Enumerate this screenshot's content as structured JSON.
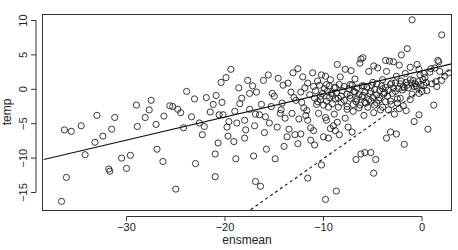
{
  "chart_data": {
    "type": "scatter",
    "title": "",
    "xlabel": "ensmean",
    "ylabel": "temp",
    "xlim": [
      -38.4,
      3.0
    ],
    "ylim": [
      -17.5,
      11.0
    ],
    "xticks": [
      -30,
      -20,
      -10,
      0
    ],
    "yticks": [
      -15,
      -10,
      -5,
      0,
      5,
      10
    ],
    "xtick_labels": [
      "−30",
      "−20",
      "−10",
      "0"
    ],
    "ytick_labels": [
      "−15",
      "−10",
      "−5",
      "0",
      "5",
      "10"
    ],
    "grid": false,
    "legend": null,
    "marker": "open-circle",
    "lines": [
      {
        "name": "regression-fit",
        "style": "solid",
        "x": [
          -38.4,
          3.0
        ],
        "y": [
          -10.2,
          3.7
        ]
      },
      {
        "name": "identity-line",
        "style": "dashed",
        "x": [
          -17.4,
          3.0
        ],
        "y": [
          -17.5,
          3.0
        ]
      }
    ],
    "points": [
      [
        -36.6,
        -16.3
      ],
      [
        -36.1,
        -12.8
      ],
      [
        -35.6,
        -6.1
      ],
      [
        -34.6,
        -5.3
      ],
      [
        -33.2,
        -7.7
      ],
      [
        -31.5,
        -5.8
      ],
      [
        -31.2,
        -4.1
      ],
      [
        -29.6,
        -9.6
      ],
      [
        -30.5,
        -10.0
      ],
      [
        -30.0,
        -11.5
      ],
      [
        -31.8,
        -11.6
      ],
      [
        -31.7,
        -11.9
      ],
      [
        -29.0,
        -2.3
      ],
      [
        -28.1,
        -4.1
      ],
      [
        -27.5,
        -1.6
      ],
      [
        -27.0,
        -5.1
      ],
      [
        -26.3,
        -10.5
      ],
      [
        -25.6,
        -2.4
      ],
      [
        -25.3,
        -2.5
      ],
      [
        -24.5,
        -3.4
      ],
      [
        -25.0,
        -14.5
      ],
      [
        -24.2,
        -5.6
      ],
      [
        -23.4,
        -4.0
      ],
      [
        -23.0,
        -10.8
      ],
      [
        -21.9,
        -1.2
      ],
      [
        -21.5,
        -3.3
      ],
      [
        -21.0,
        -9.4
      ],
      [
        -21.0,
        -12.7
      ],
      [
        -20.6,
        -3.7
      ],
      [
        -19.6,
        -4.7
      ],
      [
        -20.7,
        -7.8
      ],
      [
        -19.1,
        -7.6
      ],
      [
        -18.5,
        -2.1
      ],
      [
        -18.9,
        -10.1
      ],
      [
        -19.8,
        -5.5
      ],
      [
        -18.0,
        -4.5
      ],
      [
        -17.5,
        -0.6
      ],
      [
        -17.0,
        -5.3
      ],
      [
        -16.9,
        -13.4
      ],
      [
        -16.4,
        -14.1
      ],
      [
        -15.9,
        -4.0
      ],
      [
        -15.0,
        -1.0
      ],
      [
        -14.3,
        -3.0
      ],
      [
        -13.9,
        -4.2
      ],
      [
        -13.2,
        -3.5
      ],
      [
        -13.0,
        -1.2
      ],
      [
        -12.8,
        -1.6
      ],
      [
        -12.3,
        -6.5
      ],
      [
        -11.7,
        -3.1
      ],
      [
        -11.3,
        -5.6
      ],
      [
        -10.7,
        -2.2
      ],
      [
        -10.3,
        -1.5
      ],
      [
        -10.0,
        -6.9
      ],
      [
        -9.5,
        -2.6
      ],
      [
        -9.2,
        -0.6
      ],
      [
        -8.9,
        -3.6
      ],
      [
        -8.5,
        -1.3
      ],
      [
        -7.8,
        -4.2
      ],
      [
        -7.3,
        -0.9
      ],
      [
        -6.8,
        -0.4
      ],
      [
        -6.3,
        -2.3
      ],
      [
        -5.9,
        -3.8
      ],
      [
        -5.4,
        -1.5
      ],
      [
        -5.0,
        -1.2
      ],
      [
        -4.6,
        -0.8
      ],
      [
        -4.2,
        -3.0
      ],
      [
        -3.8,
        -0.5
      ],
      [
        -3.2,
        -1.7
      ],
      [
        -2.7,
        -0.3
      ],
      [
        -2.3,
        -2.8
      ],
      [
        -1.8,
        0.2
      ],
      [
        -1.2,
        -1.5
      ],
      [
        -0.8,
        0.4
      ],
      [
        -0.3,
        -0.6
      ],
      [
        0.2,
        0.6
      ],
      [
        0.5,
        -0.2
      ],
      [
        1.0,
        0.8
      ],
      [
        1.5,
        0.4
      ],
      [
        2.0,
        1.3
      ],
      [
        -36.3,
        -5.9
      ],
      [
        -34.2,
        -9.5
      ],
      [
        -33.0,
        -3.8
      ],
      [
        -32.4,
        -6.8
      ],
      [
        -28.9,
        -5.4
      ],
      [
        -27.7,
        -3.0
      ],
      [
        -26.9,
        -8.7
      ],
      [
        -26.2,
        -3.9
      ],
      [
        -22.6,
        -4.9
      ],
      [
        -22.3,
        -6.6
      ],
      [
        -20.3,
        -1.9
      ],
      [
        -19.0,
        -3.2
      ],
      [
        -18.0,
        -7.1
      ],
      [
        -17.5,
        -2.9
      ],
      [
        -16.5,
        -3.7
      ],
      [
        -15.5,
        -4.9
      ],
      [
        -15.3,
        -2.5
      ],
      [
        -14.7,
        -5.5
      ],
      [
        -14.0,
        -8.3
      ],
      [
        -13.5,
        -5.8
      ],
      [
        -12.6,
        -7.9
      ],
      [
        -12.0,
        -2.7
      ],
      [
        -11.6,
        -4.5
      ],
      [
        -11.0,
        -6.0
      ],
      [
        -10.5,
        -3.5
      ],
      [
        -9.8,
        -4.1
      ],
      [
        -9.5,
        -7.1
      ],
      [
        -9.0,
        -5.3
      ],
      [
        -8.6,
        -4.8
      ],
      [
        -8.2,
        -1.9
      ],
      [
        -7.6,
        -2.5
      ],
      [
        -7.0,
        -3.2
      ],
      [
        -6.6,
        -1.4
      ],
      [
        -6.0,
        -0.9
      ],
      [
        -5.7,
        -2.0
      ],
      [
        -5.2,
        -0.3
      ],
      [
        -4.8,
        -2.3
      ],
      [
        -4.4,
        -1.6
      ],
      [
        -4.0,
        0.1
      ],
      [
        -3.5,
        -1.0
      ],
      [
        -3.0,
        -0.6
      ],
      [
        -2.5,
        -1.4
      ],
      [
        -2.0,
        -0.1
      ],
      [
        -1.5,
        0.6
      ],
      [
        -1.0,
        -0.7
      ],
      [
        -0.5,
        0.3
      ],
      [
        0.0,
        -0.3
      ],
      [
        0.4,
        1.0
      ],
      [
        -21.2,
        -2.2
      ],
      [
        -20.9,
        -0.9
      ],
      [
        -20.4,
        1.0
      ],
      [
        -19.9,
        1.7
      ],
      [
        -19.4,
        2.9
      ],
      [
        -18.6,
        0.2
      ],
      [
        -18.3,
        -1.3
      ],
      [
        -17.7,
        1.3
      ],
      [
        -17.2,
        0.5
      ],
      [
        -16.8,
        -0.4
      ],
      [
        -16.1,
        1.3
      ],
      [
        -15.6,
        2.1
      ],
      [
        -15.2,
        -0.6
      ],
      [
        -14.6,
        1.6
      ],
      [
        -14.1,
        0.6
      ],
      [
        -13.6,
        0.9
      ],
      [
        -13.1,
        2.4
      ],
      [
        -12.6,
        3.0
      ],
      [
        -12.1,
        1.8
      ],
      [
        -11.6,
        0.9
      ],
      [
        -11.1,
        2.4
      ],
      [
        -10.6,
        1.2
      ],
      [
        -10.2,
        2.1
      ],
      [
        -9.7,
        0.7
      ],
      [
        -9.3,
        1.4
      ],
      [
        -8.8,
        0.3
      ],
      [
        -8.3,
        1.8
      ],
      [
        -7.8,
        2.9
      ],
      [
        -7.3,
        0.7
      ],
      [
        -6.8,
        1.5
      ],
      [
        -6.3,
        3.8
      ],
      [
        -5.9,
        0.5
      ],
      [
        -5.4,
        2.6
      ],
      [
        -5.0,
        1.0
      ],
      [
        -4.5,
        3.1
      ],
      [
        -4.0,
        1.4
      ],
      [
        -3.6,
        2.6
      ],
      [
        -3.1,
        0.9
      ],
      [
        -2.6,
        1.9
      ],
      [
        -2.2,
        0.8
      ],
      [
        -1.7,
        2.3
      ],
      [
        -1.2,
        1.4
      ],
      [
        -0.7,
        0.8
      ],
      [
        -0.2,
        2.1
      ],
      [
        0.3,
        1.7
      ],
      [
        0.8,
        2.5
      ],
      [
        1.3,
        3.1
      ],
      [
        1.8,
        2.6
      ],
      [
        -12.3,
        -0.4
      ],
      [
        -11.9,
        0.2
      ],
      [
        -11.4,
        -0.8
      ],
      [
        -11.0,
        0.4
      ],
      [
        -10.8,
        -0.2
      ],
      [
        -10.4,
        0.6
      ],
      [
        -10.1,
        -0.6
      ],
      [
        -9.9,
        0.1
      ],
      [
        -9.6,
        -0.3
      ],
      [
        -9.4,
        0.5
      ],
      [
        -9.1,
        -0.9
      ],
      [
        -8.9,
        0.2
      ],
      [
        -8.7,
        -0.5
      ],
      [
        -8.4,
        0.7
      ],
      [
        -8.1,
        -0.2
      ],
      [
        -7.9,
        0.4
      ],
      [
        -7.6,
        -0.7
      ],
      [
        -7.4,
        0.1
      ],
      [
        -7.1,
        0.6
      ],
      [
        -6.9,
        -0.3
      ],
      [
        -6.6,
        0.2
      ],
      [
        -6.4,
        -0.8
      ],
      [
        -6.1,
        0.5
      ],
      [
        -5.8,
        -0.4
      ],
      [
        -5.6,
        0.3
      ],
      [
        -5.3,
        -0.6
      ],
      [
        -5.1,
        0.6
      ],
      [
        -4.8,
        0.0
      ],
      [
        -4.6,
        0.8
      ],
      [
        -4.3,
        -0.2
      ],
      [
        -4.1,
        0.5
      ],
      [
        -3.9,
        -0.7
      ],
      [
        -3.7,
        0.3
      ],
      [
        -3.4,
        -0.1
      ],
      [
        -3.2,
        0.7
      ],
      [
        -2.9,
        0.2
      ],
      [
        -2.7,
        0.9
      ],
      [
        -2.4,
        0.1
      ],
      [
        -2.1,
        1.2
      ],
      [
        -1.9,
        0.4
      ],
      [
        -1.6,
        1.0
      ],
      [
        -1.4,
        0.2
      ],
      [
        -1.1,
        0.9
      ],
      [
        -0.9,
        1.3
      ],
      [
        -0.6,
        0.5
      ],
      [
        -0.4,
        1.1
      ],
      [
        -0.1,
        0.7
      ],
      [
        0.1,
        1.4
      ],
      [
        -10.9,
        -1.3
      ],
      [
        -10.6,
        -1.8
      ],
      [
        -10.3,
        -1.0
      ],
      [
        -10.0,
        -2.3
      ],
      [
        -9.7,
        -1.7
      ],
      [
        -9.4,
        -1.2
      ],
      [
        -9.1,
        -2.1
      ],
      [
        -8.8,
        -1.4
      ],
      [
        -8.5,
        -2.6
      ],
      [
        -8.2,
        -1.0
      ],
      [
        -7.9,
        -1.6
      ],
      [
        -7.6,
        -2.9
      ],
      [
        -7.3,
        -1.3
      ],
      [
        -7.0,
        -2.2
      ],
      [
        -6.7,
        -1.8
      ],
      [
        -6.4,
        -2.7
      ],
      [
        -6.1,
        -1.1
      ],
      [
        -5.8,
        -1.9
      ],
      [
        -5.5,
        -2.6
      ],
      [
        -5.2,
        -1.7
      ],
      [
        -4.9,
        -3.4
      ],
      [
        -4.6,
        -2.0
      ],
      [
        -4.3,
        -1.2
      ],
      [
        -4.0,
        -2.6
      ],
      [
        -3.7,
        -1.8
      ],
      [
        -3.4,
        -3.0
      ],
      [
        -3.1,
        -2.2
      ],
      [
        -2.8,
        -3.6
      ],
      [
        -2.5,
        -2.0
      ],
      [
        -2.2,
        -1.3
      ],
      [
        -1.9,
        -2.4
      ],
      [
        -1.6,
        -3.1
      ],
      [
        -9.7,
        -4.5
      ],
      [
        -9.3,
        -5.7
      ],
      [
        -8.8,
        -6.0
      ],
      [
        -8.4,
        -6.6
      ],
      [
        -7.5,
        -5.5
      ],
      [
        -7.1,
        -6.2
      ],
      [
        -6.2,
        -9.4
      ],
      [
        -5.8,
        -9.2
      ],
      [
        -4.7,
        -10.2
      ],
      [
        -3.6,
        -7.1
      ],
      [
        -2.6,
        -6.5
      ],
      [
        -1.8,
        -8.0
      ],
      [
        -0.8,
        -4.7
      ],
      [
        1.2,
        -2.3
      ],
      [
        -0.3,
        -3.7
      ],
      [
        0.6,
        -5.8
      ],
      [
        -11.6,
        -12.9
      ],
      [
        -10.2,
        -11.0
      ],
      [
        -9.8,
        -16.0
      ],
      [
        -8.7,
        -14.8
      ],
      [
        -6.7,
        -10.2
      ],
      [
        -5.2,
        -9.2
      ],
      [
        -4.9,
        -12.2
      ],
      [
        -3.2,
        -6.2
      ],
      [
        -6.2,
        4.4
      ],
      [
        -6.0,
        4.6
      ],
      [
        -4.9,
        3.4
      ],
      [
        -3.7,
        4.2
      ],
      [
        -3.3,
        4.1
      ],
      [
        -2.9,
        4.0
      ],
      [
        -2.3,
        3.5
      ],
      [
        -1.5,
        5.9
      ],
      [
        -2.1,
        5.0
      ],
      [
        -1.0,
        10.1
      ],
      [
        1.7,
        4.0
      ],
      [
        1.6,
        4.2
      ],
      [
        2.0,
        7.9
      ],
      [
        -7.2,
        2.7
      ],
      [
        -8.6,
        3.6
      ],
      [
        -9.8,
        1.9
      ],
      [
        -1.2,
        3.2
      ],
      [
        -0.5,
        3.6
      ],
      [
        0.2,
        2.3
      ],
      [
        0.9,
        3.0
      ],
      [
        -0.3,
        2.9
      ],
      [
        1.4,
        1.1
      ],
      [
        2.3,
        1.9
      ],
      [
        2.7,
        2.4
      ],
      [
        -24.8,
        -2.9
      ],
      [
        -23.9,
        -0.3
      ],
      [
        -23.1,
        -1.4
      ],
      [
        -22.1,
        -5.4
      ],
      [
        -19.7,
        -6.8
      ],
      [
        -17.9,
        -5.9
      ],
      [
        -16.3,
        -2.2
      ],
      [
        -14.4,
        -3.5
      ],
      [
        -13.7,
        -6.9
      ],
      [
        -12.9,
        -6.6
      ],
      [
        -12.5,
        -4.3
      ],
      [
        -11.3,
        -7.4
      ],
      [
        -10.9,
        -8.1
      ],
      [
        -15.8,
        -8.7
      ],
      [
        -17.1,
        -9.7
      ],
      [
        -14.9,
        -10.1
      ],
      [
        -20.2,
        -3.7
      ],
      [
        -18.8,
        -4.9
      ],
      [
        -16.9,
        -3.6
      ],
      [
        -16.0,
        -6.3
      ],
      [
        -14.2,
        -2.0
      ],
      [
        -13.3,
        -0.4
      ],
      [
        -12.2,
        -1.9
      ],
      [
        -11.8,
        -3.8
      ]
    ]
  }
}
